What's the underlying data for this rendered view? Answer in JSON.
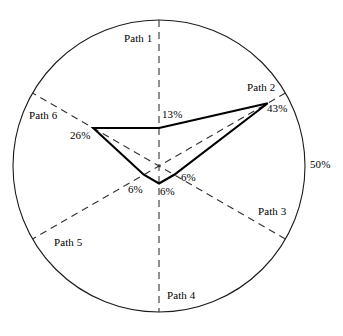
{
  "chart_data": {
    "type": "radar",
    "title": "",
    "subtitle": "",
    "xlabel": "",
    "ylabel": "",
    "categories": [
      "Path 1",
      "Path 2",
      "Path 3",
      "Path 4",
      "Path 5",
      "Path 6"
    ],
    "values": [
      13,
      43,
      6,
      6,
      6,
      26
    ],
    "value_labels": [
      "13%",
      "43%",
      "6%",
      "6%",
      "6%",
      "26%"
    ],
    "units": "%",
    "rmax": 50,
    "rmax_label": "50%",
    "rmin": 0,
    "grid": false,
    "legend": "none",
    "axis_style": "dashed",
    "series": [
      {
        "name": "",
        "values": [
          13,
          43,
          6,
          6,
          6,
          26
        ]
      }
    ],
    "axis_angles_deg": [
      90,
      30,
      -30,
      -90,
      -150,
      150
    ],
    "colors": {
      "outline": "#1a1a1a",
      "axis": "#333333",
      "series": "#000000",
      "background": "#ffffff",
      "text": "#000000"
    }
  },
  "labels": {
    "path1": "Path 1",
    "path2": "Path 2",
    "path3": "Path 3",
    "path4": "Path 4",
    "path5": "Path 5",
    "path6": "Path 6"
  },
  "values": {
    "path1": "13%",
    "path2": "43%",
    "path3": "6%",
    "path4": "6%",
    "path5": "6%",
    "path6": "26%"
  },
  "scale": {
    "outer": "50%"
  }
}
